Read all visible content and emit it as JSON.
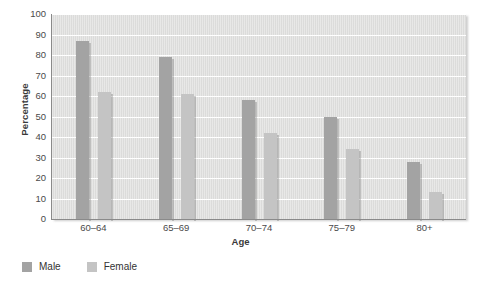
{
  "chart_data": {
    "type": "bar",
    "title": "",
    "categories": [
      "60–64",
      "65–69",
      "70–74",
      "75–79",
      "80+"
    ],
    "series": [
      {
        "name": "Male",
        "color": "#a3a3a3",
        "values": [
          87,
          79,
          58,
          50,
          28
        ]
      },
      {
        "name": "Female",
        "color": "#c4c4c4",
        "values": [
          62,
          61,
          42,
          34,
          13
        ]
      }
    ],
    "xlabel": "Age",
    "ylabel": "Percentage",
    "ylim": [
      0,
      100
    ],
    "yticks": [
      0,
      10,
      20,
      30,
      40,
      50,
      60,
      70,
      80,
      90,
      100
    ],
    "grid": true,
    "legend_position": "bottom-left",
    "plot_background": "#dededd",
    "gridline_color": "#ffffff",
    "axis_color": "#8a8a8a"
  },
  "legend": {
    "items": [
      {
        "label": "Male",
        "color": "#a3a3a3"
      },
      {
        "label": "Female",
        "color": "#c4c4c4"
      }
    ]
  }
}
